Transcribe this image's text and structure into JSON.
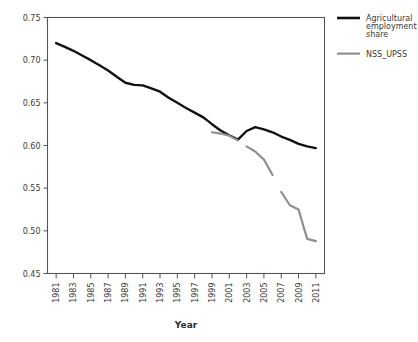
{
  "chart_data": {
    "type": "line",
    "title": "",
    "xlabel": "Year",
    "ylabel": "",
    "xlim": [
      1980,
      2012
    ],
    "ylim": [
      0.45,
      0.75
    ],
    "grid": false,
    "legend_position": "right",
    "y_ticks": [
      "0.75",
      "0.70",
      "0.65",
      "0.60",
      "0.55",
      "0.50",
      "0.45"
    ],
    "y_tick_values": [
      0.75,
      0.7,
      0.65,
      0.6,
      0.55,
      0.5,
      0.45
    ],
    "x_ticks": [
      "1981",
      "1983",
      "1985",
      "1987",
      "1989",
      "1991",
      "1993",
      "1995",
      "1997",
      "1999",
      "2001",
      "2003",
      "2005",
      "2007",
      "2009",
      "2011"
    ],
    "x_tick_values": [
      1981,
      1983,
      1985,
      1987,
      1989,
      1991,
      1993,
      1995,
      1997,
      1999,
      2001,
      2003,
      2005,
      2007,
      2009,
      2011
    ],
    "series": [
      {
        "name": "Agricultural employment share",
        "color": "#111111",
        "width": 2.4,
        "segments": [
          {
            "x": [
              1981,
              1982,
              1983,
              1984,
              1985,
              1986,
              1987,
              1988,
              1989,
              1990,
              1991,
              1992,
              1993,
              1994,
              1995,
              1996,
              1997,
              1998,
              1999,
              2000,
              2001,
              2002,
              2003,
              2004,
              2005,
              2006,
              2007,
              2008,
              2009,
              2010,
              2011
            ],
            "y": [
              0.72,
              0.7155,
              0.711,
              0.7055,
              0.7,
              0.694,
              0.688,
              0.6805,
              0.6735,
              0.671,
              0.6705,
              0.667,
              0.663,
              0.656,
              0.65,
              0.644,
              0.6385,
              0.633,
              0.625,
              0.6175,
              0.612,
              0.607,
              0.617,
              0.6215,
              0.619,
              0.6155,
              0.6105,
              0.6065,
              0.602,
              0.599,
              0.597
            ]
          }
        ]
      },
      {
        "name": "NSS_UPSS",
        "color": "#8e8e8e",
        "width": 2.2,
        "segments": [
          {
            "x": [
              1999,
              2000,
              2001,
              2002
            ],
            "y": [
              0.6155,
              0.614,
              0.6115,
              0.606
            ]
          },
          {
            "x": [
              2003,
              2004,
              2005,
              2006
            ],
            "y": [
              0.599,
              0.593,
              0.5835,
              0.5655
            ]
          },
          {
            "x": [
              2007,
              2008,
              2009,
              2010,
              2011
            ],
            "y": [
              0.5455,
              0.53,
              0.525,
              0.4905,
              0.488
            ]
          }
        ]
      }
    ]
  },
  "legend": {
    "entries": [
      {
        "label": "Agricultural employment share",
        "color": "#111111"
      },
      {
        "label": "NSS_UPSS",
        "color": "#8e8e8e"
      }
    ]
  }
}
